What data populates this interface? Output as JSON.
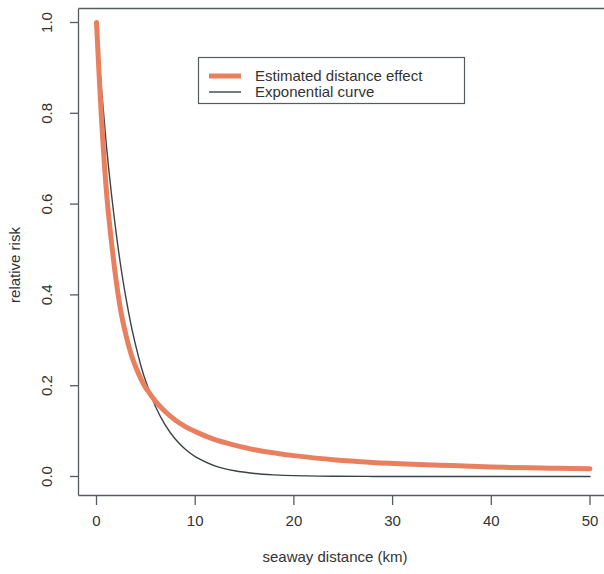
{
  "chart_data": {
    "type": "line",
    "title": "",
    "xlabel": "seaway distance (km)",
    "ylabel": "relative risk",
    "xlim": [
      0,
      50
    ],
    "ylim": [
      0.0,
      1.0
    ],
    "grid": false,
    "legend_position": "top-center",
    "xticks": [
      0,
      10,
      20,
      30,
      40,
      50
    ],
    "xtick_labels": [
      "0",
      "10",
      "20",
      "30",
      "40",
      "50"
    ],
    "yticks": [
      0.0,
      0.2,
      0.4,
      0.6,
      0.8,
      1.0
    ],
    "ytick_labels": [
      "0.0",
      "0.2",
      "0.4",
      "0.6",
      "0.8",
      "1.0"
    ],
    "colors": {
      "estimated": "#E8805F",
      "exponential": "#3b4246",
      "axis": "#555c60"
    },
    "x": [
      0,
      0.5,
      1,
      1.5,
      2,
      2.5,
      3,
      3.5,
      4,
      4.5,
      5,
      6,
      7,
      8,
      9,
      10,
      12,
      14,
      16,
      18,
      20,
      24,
      28,
      32,
      36,
      40,
      44,
      47,
      50
    ],
    "series": [
      {
        "name": "Estimated distance effect",
        "linewidth": 5,
        "values": [
          1.0,
          0.79,
          0.63,
          0.52,
          0.43,
          0.36,
          0.31,
          0.27,
          0.24,
          0.215,
          0.195,
          0.165,
          0.142,
          0.124,
          0.11,
          0.099,
          0.081,
          0.069,
          0.059,
          0.052,
          0.046,
          0.037,
          0.031,
          0.027,
          0.024,
          0.021,
          0.019,
          0.018,
          0.017
        ]
      },
      {
        "name": "Exponential curve",
        "linewidth": 1.4,
        "values": [
          1.0,
          0.855,
          0.73,
          0.625,
          0.535,
          0.457,
          0.391,
          0.334,
          0.286,
          0.244,
          0.209,
          0.153,
          0.112,
          0.082,
          0.06,
          0.044,
          0.0235,
          0.0126,
          0.0067,
          0.0036,
          0.0019,
          0.00055,
          0.00016,
          5e-05,
          1e-05,
          4e-06,
          1e-06,
          5e-07,
          2e-07
        ]
      }
    ],
    "legend_entries": [
      {
        "label": "Estimated distance effect",
        "color": "#E8805F",
        "linewidth": 5
      },
      {
        "label": "Exponential curve",
        "color": "#3b4246",
        "linewidth": 1.4
      }
    ]
  },
  "axes": {
    "x_title": "seaway distance (km)",
    "y_title": "relative risk"
  },
  "legend": {
    "entry_0_label": "Estimated distance effect",
    "entry_1_label": "Exponential curve"
  },
  "xtick_labels": {
    "t0": "0",
    "t1": "10",
    "t2": "20",
    "t3": "30",
    "t4": "40",
    "t5": "50"
  },
  "ytick_labels": {
    "t0": "0.0",
    "t1": "0.2",
    "t2": "0.4",
    "t3": "0.6",
    "t4": "0.8",
    "t5": "1.0"
  }
}
